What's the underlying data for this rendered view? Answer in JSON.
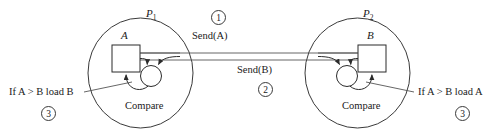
{
  "diagram": {
    "background_color": "#ffffff",
    "line_color": "#2b2b2b",
    "processes": [
      {
        "id": "P1",
        "name": "P",
        "subscript": "1",
        "variable_label": "A",
        "operation_label": "Compare",
        "condition_label": "If A > B load B",
        "condition_step": "3"
      },
      {
        "id": "P2",
        "name": "P",
        "subscript": "2",
        "variable_label": "B",
        "operation_label": "Compare",
        "condition_label": "If A > B load A",
        "condition_step": "3"
      }
    ],
    "messages": [
      {
        "id": "msg-send-a",
        "label": "Send(A)",
        "step": "1",
        "direction": "left-to-right"
      },
      {
        "id": "msg-send-b",
        "label": "Send(B)",
        "step": "2",
        "direction": "right-to-left"
      }
    ]
  }
}
